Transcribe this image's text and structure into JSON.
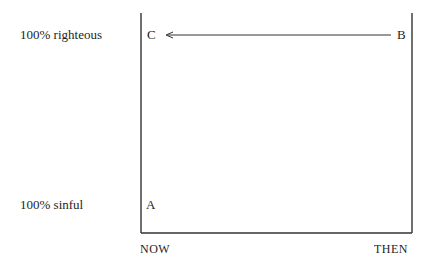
{
  "diagram": {
    "y_axis_labels": {
      "top": "100% righteous",
      "bottom": "100% sinful"
    },
    "x_axis_labels": {
      "left": "NOW",
      "right": "THEN"
    },
    "points": {
      "A": "A",
      "B": "B",
      "C": "C"
    },
    "arrow": {
      "from": "B",
      "to": "C"
    },
    "colors": {
      "line": "#333333",
      "text": "#1e1e1e",
      "background": "#ffffff"
    }
  }
}
